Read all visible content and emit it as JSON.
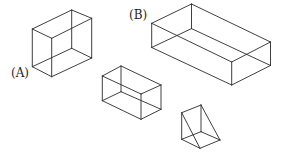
{
  "figure": {
    "line_color": "#2a2a2a",
    "background": "#ffffff",
    "labels": {
      "a": "(A)",
      "b": "(B)"
    },
    "shapes": [
      {
        "id": "box-a",
        "label": "(A)",
        "kind": "rectangular prism (tall)",
        "vertices": {
          "top_back": [
            71.7,
            10
          ],
          "top_left": [
            32.3,
            29
          ],
          "top_right": [
            91.7,
            18.3
          ],
          "top_front": [
            51.7,
            38.3
          ],
          "bottom_back": [
            71.7,
            48.3
          ],
          "bottom_left": [
            32.3,
            66.7
          ],
          "bottom_right": [
            91.7,
            58
          ],
          "bottom_front": [
            51.7,
            76.7
          ]
        }
      },
      {
        "id": "box-b",
        "label": "(B)",
        "kind": "rectangular prism (long, flat)",
        "vertices": {
          "top_back": [
            191.5,
            4
          ],
          "top_left": [
            151.7,
            23.3
          ],
          "top_right": [
            270.5,
            42
          ],
          "top_front": [
            231.7,
            62
          ],
          "bottom_back": [
            191.5,
            28.6
          ],
          "bottom_left": [
            151.7,
            47.5
          ],
          "bottom_right": [
            270.5,
            65.5
          ],
          "bottom_front": [
            231.7,
            85
          ]
        }
      },
      {
        "id": "box-c",
        "label": "",
        "kind": "rectangular prism (small)",
        "vertices": {
          "top_back": [
            121,
            66
          ],
          "top_left": [
            102.3,
            76
          ],
          "top_right": [
            161,
            85
          ],
          "top_front": [
            141,
            94
          ],
          "bottom_back": [
            121,
            91.7
          ],
          "bottom_left": [
            102.3,
            100.7
          ],
          "bottom_right": [
            161,
            109.3
          ],
          "bottom_front": [
            141,
            119.3
          ]
        }
      },
      {
        "id": "wedge",
        "label": "",
        "kind": "triangular prism (wedge)",
        "vertices": {
          "apex": [
            201,
            105
          ],
          "top_left": [
            181.7,
            112.7
          ],
          "bottom_left": [
            181.7,
            139.3
          ],
          "bottom_back": [
            201,
            131.7
          ],
          "bottom_right": [
            220,
            140
          ],
          "bottom_front": [
            200,
            148.3
          ]
        }
      }
    ]
  }
}
